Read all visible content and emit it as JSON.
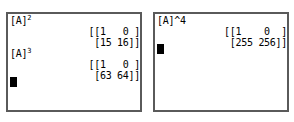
{
  "screens": [
    {
      "name": "left-screen",
      "lines": [
        {
          "type": "entry",
          "text": "[A]",
          "exponent": "2"
        },
        {
          "type": "result",
          "text": "[[1   0 ]"
        },
        {
          "type": "result",
          "text": "[15 16]]"
        },
        {
          "type": "entry",
          "text": "[A]",
          "exponent": "3"
        },
        {
          "type": "result",
          "text": "[[1   0 ]"
        },
        {
          "type": "result",
          "text": "[63 64]]"
        }
      ],
      "cursor_row": 6
    },
    {
      "name": "right-screen",
      "lines": [
        {
          "type": "entry",
          "text": "[A]^4",
          "exponent": ""
        },
        {
          "type": "result",
          "text": "[[1    0  ]"
        },
        {
          "type": "result",
          "text": "[255 256]]"
        }
      ],
      "cursor_row": 3
    }
  ],
  "matrices": {
    "A_squared": {
      "label": "[A]²",
      "rows": [
        [
          1,
          0
        ],
        [
          15,
          16
        ]
      ]
    },
    "A_cubed": {
      "label": "[A]³",
      "rows": [
        [
          1,
          0
        ],
        [
          63,
          64
        ]
      ]
    },
    "A_fourth": {
      "label": "[A]^4",
      "rows": [
        [
          1,
          0
        ],
        [
          255,
          256
        ]
      ]
    }
  },
  "colors": {
    "screen_background": "#ffffff",
    "screen_border": "#5a5a5a",
    "text": "#000000",
    "cursor": "#000000",
    "page_background": "#ffffff"
  }
}
